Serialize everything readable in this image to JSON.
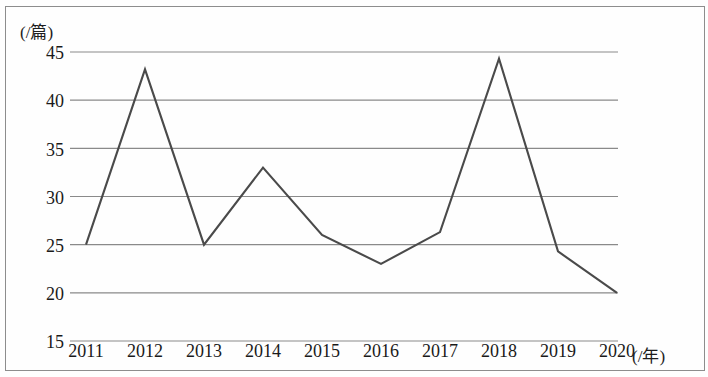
{
  "chart_data": {
    "type": "line",
    "title": "",
    "subtitle": "",
    "xlabel": "(/年)",
    "ylabel": "(/篇)",
    "categories": [
      "2011",
      "2012",
      "2013",
      "2014",
      "2015",
      "2016",
      "2017",
      "2018",
      "2019",
      "2020"
    ],
    "values": [
      25,
      43.2,
      25,
      33,
      26,
      23,
      26.3,
      44.3,
      24.3,
      20
    ],
    "series": [
      {
        "name": "",
        "values": [
          25,
          43.2,
          25,
          33,
          26,
          23,
          26.3,
          44.3,
          24.3,
          20
        ]
      }
    ],
    "ylim": [
      15,
      45
    ],
    "yticks": [
      "45",
      "40",
      "35",
      "30",
      "25",
      "20",
      "15"
    ],
    "ytick_values": [
      45,
      40,
      35,
      30,
      25,
      20,
      15
    ],
    "grid": true,
    "grid_axis": "y",
    "legend": "none",
    "line_color": "#4a4a4a",
    "grid_color": "#8a8a8a",
    "markers": false
  },
  "axes": {
    "y_unit_label": "(/篇)",
    "x_unit_label": "(/年)"
  }
}
